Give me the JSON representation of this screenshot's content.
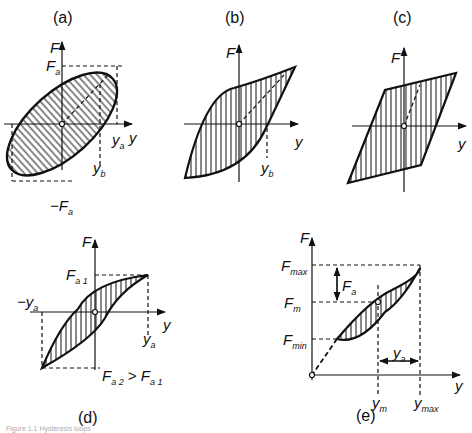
{
  "figure": {
    "panels": [
      {
        "id": "a",
        "caption": "(a)",
        "labels": {
          "F": "F",
          "Fa": "F",
          "Fa_sub": "a",
          "neg": "−F",
          "neg_sub": "a",
          "ya": "y",
          "ya_sub": "a",
          "yb": "y",
          "yb_sub": "b",
          "y": "y"
        }
      },
      {
        "id": "b",
        "caption": "(b)",
        "labels": {
          "F": "F",
          "yb": "y",
          "yb_sub": "b",
          "y": "y"
        }
      },
      {
        "id": "c",
        "caption": "(c)",
        "labels": {
          "F": "F",
          "y": "y"
        }
      },
      {
        "id": "d",
        "caption": "(d)",
        "labels": {
          "F": "F",
          "Fa1": "F",
          "Fa1_sub": "a 1",
          "negya": "−y",
          "negya_sub": "a",
          "ya": "y",
          "ya_sub": "a",
          "y": "y",
          "cond": "F",
          "cond_sub1": "a 2",
          "cond_mid": " > F",
          "cond_sub2": "a 1"
        }
      },
      {
        "id": "e",
        "caption": "(e)",
        "labels": {
          "F": "F",
          "Fmax": "F",
          "Fmax_sub": "max",
          "Fm": "F",
          "Fm_sub": "m",
          "Fmin": "F",
          "Fmin_sub": "min",
          "Fa": "F",
          "Fa_sub": "a",
          "ya": "y",
          "ya_sub": "a",
          "ym": "y",
          "ym_sub": "m",
          "ymax": "y",
          "ymax_sub": "max",
          "y": "y"
        }
      }
    ],
    "footer": "Figure 1.1 Hysteresis loops"
  }
}
